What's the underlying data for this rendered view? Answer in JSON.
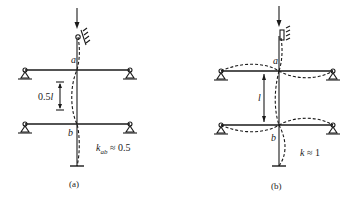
{
  "diagram": {
    "panels": [
      {
        "id": "a",
        "caption": "(a)",
        "joint_top": "a",
        "joint_bottom": "b",
        "dimension_label": "0.5l",
        "k_symbol": "k",
        "k_subscript": "ab",
        "k_value": "≈ 0.5",
        "buckled_shape": "column buckles between joints a and b with inflection; beams remain straight"
      },
      {
        "id": "b",
        "caption": "(b)",
        "joint_top": "a",
        "joint_bottom": "b",
        "dimension_label": "l",
        "k_symbol": "k",
        "k_subscript": "",
        "k_value": "≈ 1",
        "buckled_shape": "beams rotate with joints, column segment ab buckles in single curvature"
      }
    ],
    "colors": {
      "line": "#1a1a1a",
      "background": "#ffffff"
    }
  }
}
